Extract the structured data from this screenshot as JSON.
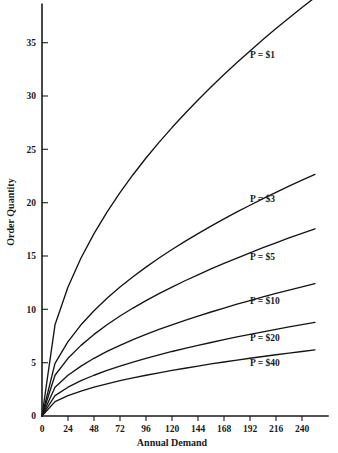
{
  "chart_data": {
    "type": "line",
    "title": "",
    "subtitle": "",
    "xlabel": "Annual Demand",
    "ylabel": "Order Quantity",
    "xlim": [
      0,
      264
    ],
    "ylim": [
      0,
      38.5
    ],
    "grid": false,
    "legend_position": "inline-right-of-curve",
    "x_ticks": [
      0,
      24,
      48,
      72,
      96,
      120,
      144,
      168,
      192,
      216,
      240
    ],
    "x_tick_labels": [
      "0",
      "24",
      "48",
      "72",
      "96",
      "120",
      "144",
      "168",
      "192",
      "216",
      "240"
    ],
    "y_ticks": [
      0,
      5,
      10,
      15,
      20,
      25,
      30,
      35
    ],
    "y_tick_labels": [
      "0",
      "5",
      "10",
      "15",
      "20",
      "25",
      "30",
      "35"
    ],
    "x": [
      0,
      12,
      24,
      36,
      48,
      60,
      72,
      84,
      96,
      108,
      120,
      132,
      144,
      156,
      168,
      180,
      192,
      204,
      216,
      228,
      240,
      252
    ],
    "series": [
      {
        "name": "P = $1",
        "label": "P = $1",
        "label_x": 192,
        "label_y": 33.6,
        "price": 1,
        "values": [
          0,
          8.55,
          12.09,
          14.81,
          17.1,
          19.12,
          20.95,
          22.62,
          24.19,
          25.65,
          27.04,
          28.36,
          29.63,
          30.84,
          32.01,
          33.14,
          34.23,
          35.29,
          36.32,
          37.32,
          38.3,
          39.24
        ]
      },
      {
        "name": "P = $3",
        "label": "P = $3",
        "label_x": 192,
        "label_y": 20.1,
        "price": 3,
        "values": [
          0,
          4.94,
          6.98,
          8.55,
          9.87,
          11.04,
          12.09,
          13.06,
          13.96,
          14.81,
          15.61,
          16.37,
          17.1,
          17.8,
          18.48,
          19.13,
          19.76,
          20.37,
          20.97,
          21.55,
          22.11,
          22.65
        ]
      },
      {
        "name": "P = $5",
        "label": "P = $5",
        "label_x": 192,
        "label_y": 14.6,
        "price": 5,
        "values": [
          0,
          3.82,
          5.41,
          6.62,
          7.65,
          8.55,
          9.37,
          10.12,
          10.81,
          11.47,
          12.09,
          12.68,
          13.24,
          13.79,
          14.31,
          14.81,
          15.3,
          15.78,
          16.24,
          16.69,
          17.13,
          17.55
        ]
      },
      {
        "name": "P = $10",
        "label": "P = $10",
        "label_x": 192,
        "label_y": 10.5,
        "price": 10,
        "values": [
          0,
          2.7,
          3.82,
          4.68,
          5.41,
          6.05,
          6.62,
          7.16,
          7.65,
          8.11,
          8.55,
          8.97,
          9.37,
          9.75,
          10.12,
          10.48,
          10.82,
          11.16,
          11.49,
          11.8,
          12.11,
          12.41
        ]
      },
      {
        "name": "P = $20",
        "label": "P = $20",
        "label_x": 192,
        "label_y": 7.0,
        "price": 20,
        "values": [
          0,
          1.91,
          2.7,
          3.31,
          3.82,
          4.28,
          4.68,
          5.06,
          5.41,
          5.73,
          6.05,
          6.34,
          6.62,
          6.89,
          7.16,
          7.41,
          7.65,
          7.89,
          8.12,
          8.35,
          8.56,
          8.77
        ]
      },
      {
        "name": "P = $40",
        "label": "P = $40",
        "label_x": 192,
        "label_y": 4.7,
        "price": 40,
        "values": [
          0,
          1.35,
          1.91,
          2.34,
          2.7,
          3.02,
          3.31,
          3.58,
          3.82,
          4.05,
          4.28,
          4.48,
          4.68,
          4.88,
          5.06,
          5.24,
          5.41,
          5.58,
          5.74,
          5.9,
          6.05,
          6.2
        ]
      }
    ],
    "colors": {
      "curve": "#141414",
      "axis": "#1a1a1a",
      "text": "#1a1a1a",
      "background": "#ffffff"
    }
  }
}
